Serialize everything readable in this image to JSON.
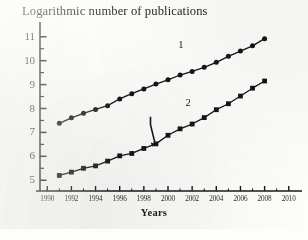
{
  "chart_data": {
    "type": "line",
    "title": "Logarithmic number of publications",
    "xlabel": "Years",
    "ylabel": "",
    "xlim": [
      1989.4,
      2010.6
    ],
    "ylim": [
      4.55,
      11.45
    ],
    "xticks": [
      1990,
      1992,
      1994,
      1996,
      1998,
      2000,
      2002,
      2004,
      2006,
      2008,
      2010
    ],
    "xtick_labels": [
      "1990",
      "1992",
      "1994",
      "1996",
      "1998",
      "2000",
      "2002",
      "2004",
      "2006",
      "2008",
      "2010"
    ],
    "yticks": [
      5,
      6,
      7,
      8,
      9,
      10,
      11
    ],
    "ytick_labels": [
      "5",
      "6",
      "7",
      "8",
      "9",
      "10",
      "11"
    ],
    "minor_yticks": [
      5.5,
      6.5,
      7.5,
      8.5,
      9.5,
      10.5
    ],
    "minor_xticks": [
      1991,
      1993,
      1995,
      1997,
      1999,
      2001,
      2003,
      2005,
      2007,
      2009
    ],
    "grid": false,
    "legend_position": "inline-annotation",
    "axis_color": "#1b1b1b",
    "series": [
      {
        "name": "1",
        "label": "1",
        "marker": "circle",
        "color": "#171717",
        "label_x": 2001.1,
        "label_y": 10.62,
        "x": [
          1991,
          1992,
          1993,
          1994,
          1995,
          1996,
          1997,
          1998,
          1999,
          2000,
          2001,
          2002,
          2003,
          2004,
          2005,
          2006,
          2007,
          2008
        ],
        "values": [
          7.38,
          7.61,
          7.8,
          7.96,
          8.12,
          8.4,
          8.62,
          8.82,
          9.02,
          9.2,
          9.4,
          9.55,
          9.72,
          9.93,
          10.18,
          10.4,
          10.62,
          10.92
        ]
      },
      {
        "name": "2",
        "label": "2",
        "marker": "square",
        "color": "#171717",
        "label_x": 2001.7,
        "label_y": 8.2,
        "x": [
          1991,
          1992,
          1993,
          1994,
          1995,
          1996,
          1997,
          1998,
          1999,
          2000,
          2001,
          2002,
          2003,
          2004,
          2005,
          2006,
          2007,
          2008
        ],
        "values": [
          5.2,
          5.34,
          5.5,
          5.6,
          5.8,
          6.02,
          6.12,
          6.33,
          6.52,
          6.88,
          7.15,
          7.35,
          7.62,
          7.95,
          8.2,
          8.52,
          8.85,
          9.15
        ]
      }
    ],
    "annotations": [
      {
        "name": "arrow-to-1999",
        "type": "arrow",
        "target_x": 1999,
        "target_y": 6.52,
        "tail_x": 1998.55,
        "tail_y": 7.32
      }
    ]
  }
}
